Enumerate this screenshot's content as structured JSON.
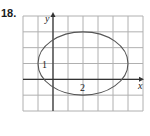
{
  "problem_number": "18.",
  "chart_data": {
    "type": "line",
    "title": "",
    "xlabel": "x",
    "ylabel": "y",
    "xlim": [
      -2,
      6
    ],
    "ylim": [
      -2,
      4
    ],
    "grid": true,
    "grid_step": 1,
    "annotations": [
      {
        "text": "1",
        "x": -1,
        "y": 1
      },
      {
        "text": "2",
        "x": 2,
        "y": -0.5
      }
    ],
    "series": [
      {
        "name": "ellipse",
        "shape": "ellipse",
        "center": [
          2,
          1
        ],
        "semi_axis_x": 3,
        "semi_axis_y": 2
      }
    ]
  },
  "colors": {
    "grid": "#b0b0b0",
    "axis": "#333333",
    "curve": "#555555"
  }
}
